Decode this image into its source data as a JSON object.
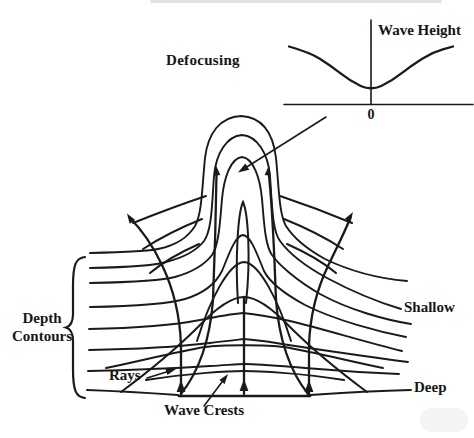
{
  "colors": {
    "ink": "#1a1a1a",
    "background": "#ffffff"
  },
  "labels": {
    "defocusing": "Defocusing",
    "wave_height": "Wave Height",
    "zero": "0",
    "depth_line1": "Depth",
    "depth_line2": "Contours",
    "rays": "Rays",
    "wave_crests": "Wave Crests",
    "shallow": "Shallow",
    "deep": "Deep"
  },
  "chart_data": {
    "type": "line",
    "title": "",
    "xlabel": "",
    "ylabel": "Wave Height",
    "xtick_labels": [
      "0"
    ],
    "x": [
      -1,
      -0.75,
      -0.5,
      -0.25,
      0,
      0.25,
      0.5,
      0.75,
      1
    ],
    "y": [
      1.0,
      0.9,
      0.68,
      0.4,
      0.24,
      0.4,
      0.68,
      0.9,
      1.0
    ]
  }
}
